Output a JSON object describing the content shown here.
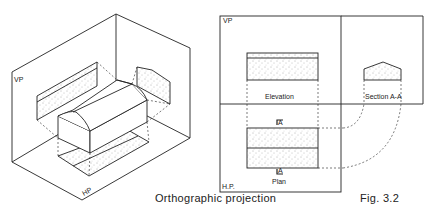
{
  "figure": {
    "caption": "Orthographic projection",
    "fig_number": "Fig. 3.2"
  },
  "isometric": {
    "vp_label": "VP",
    "hp_label": "HP"
  },
  "ortho": {
    "vp_label": "VP",
    "hp_label": "H.P.",
    "elevation_label": "Elevation",
    "section_label": "Section A-A",
    "plan_label": "Plan",
    "cut_top": "A",
    "cut_bottom": "A"
  },
  "colors": {
    "line": "#222222",
    "stipple": "#555555",
    "background": "#ffffff"
  }
}
